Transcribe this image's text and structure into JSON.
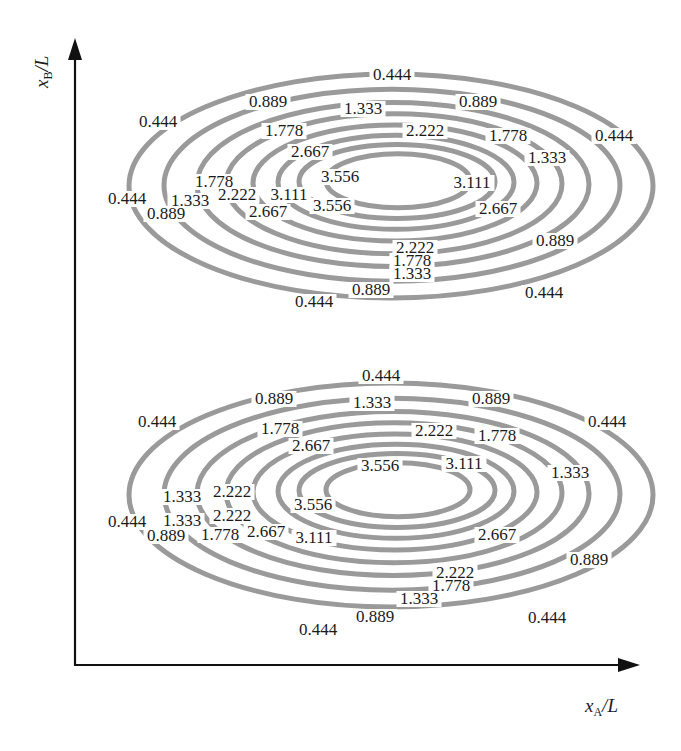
{
  "chart_data": {
    "type": "contour",
    "title": "",
    "xlabel": "x_A/L",
    "ylabel": "x_B/L",
    "grid": false,
    "legend": null,
    "levels": [
      0.444,
      0.889,
      1.333,
      1.778,
      2.222,
      2.667,
      3.111,
      3.556
    ],
    "level_labels": [
      "0.444",
      "0.889",
      "1.333",
      "1.778",
      "2.222",
      "2.667",
      "3.111",
      "3.556"
    ],
    "line_color": "#9a9a9a",
    "lobes": [
      {
        "name": "upper",
        "center_px": [
          395,
          183
        ],
        "labels": [
          {
            "text": "0.444",
            "x": 392,
            "y": 80
          },
          {
            "text": "0.889",
            "x": 268,
            "y": 107
          },
          {
            "text": "1.333",
            "x": 363,
            "y": 114
          },
          {
            "text": "0.889",
            "x": 478,
            "y": 107
          },
          {
            "text": "0.444",
            "x": 158,
            "y": 127
          },
          {
            "text": "1.778",
            "x": 284,
            "y": 136
          },
          {
            "text": "2.222",
            "x": 425,
            "y": 136
          },
          {
            "text": "1.778",
            "x": 508,
            "y": 141
          },
          {
            "text": "0.444",
            "x": 614,
            "y": 141
          },
          {
            "text": "2.667",
            "x": 310,
            "y": 157
          },
          {
            "text": "3.556",
            "x": 340,
            "y": 182
          },
          {
            "text": "1.333",
            "x": 547,
            "y": 163
          },
          {
            "text": "1.778",
            "x": 214,
            "y": 187
          },
          {
            "text": "3.111",
            "x": 472,
            "y": 188
          },
          {
            "text": "0.444",
            "x": 127,
            "y": 204
          },
          {
            "text": "1.333",
            "x": 190,
            "y": 206
          },
          {
            "text": "2.222",
            "x": 237,
            "y": 200
          },
          {
            "text": "3.111",
            "x": 289,
            "y": 200
          },
          {
            "text": "3.556",
            "x": 332,
            "y": 211
          },
          {
            "text": "0.889",
            "x": 166,
            "y": 219
          },
          {
            "text": "2.667",
            "x": 268,
            "y": 217
          },
          {
            "text": "2.667",
            "x": 498,
            "y": 214
          },
          {
            "text": "2.222",
            "x": 415,
            "y": 253
          },
          {
            "text": "0.889",
            "x": 555,
            "y": 246
          },
          {
            "text": "1.778",
            "x": 412,
            "y": 266
          },
          {
            "text": "1.333",
            "x": 412,
            "y": 279
          },
          {
            "text": "0.889",
            "x": 371,
            "y": 295
          },
          {
            "text": "0.444",
            "x": 544,
            "y": 298
          },
          {
            "text": "0.444",
            "x": 314,
            "y": 307
          }
        ]
      },
      {
        "name": "lower",
        "center_px": [
          395,
          492
        ],
        "labels": [
          {
            "text": "0.444",
            "x": 381,
            "y": 381
          },
          {
            "text": "0.889",
            "x": 274,
            "y": 404
          },
          {
            "text": "1.333",
            "x": 372,
            "y": 408
          },
          {
            "text": "0.889",
            "x": 491,
            "y": 404
          },
          {
            "text": "0.444",
            "x": 157,
            "y": 427
          },
          {
            "text": "1.778",
            "x": 280,
            "y": 434
          },
          {
            "text": "2.222",
            "x": 434,
            "y": 436
          },
          {
            "text": "1.778",
            "x": 497,
            "y": 441
          },
          {
            "text": "0.444",
            "x": 607,
            "y": 427
          },
          {
            "text": "2.667",
            "x": 311,
            "y": 451
          },
          {
            "text": "3.556",
            "x": 380,
            "y": 471
          },
          {
            "text": "3.111",
            "x": 464,
            "y": 469
          },
          {
            "text": "1.333",
            "x": 570,
            "y": 478
          },
          {
            "text": "1.333",
            "x": 182,
            "y": 502
          },
          {
            "text": "2.222",
            "x": 232,
            "y": 497
          },
          {
            "text": "3.556",
            "x": 313,
            "y": 510
          },
          {
            "text": "0.444",
            "x": 127,
            "y": 527
          },
          {
            "text": "1.333",
            "x": 182,
            "y": 526
          },
          {
            "text": "2.222",
            "x": 232,
            "y": 521
          },
          {
            "text": "0.889",
            "x": 166,
            "y": 541
          },
          {
            "text": "1.778",
            "x": 220,
            "y": 540
          },
          {
            "text": "2.667",
            "x": 266,
            "y": 537
          },
          {
            "text": "3.111",
            "x": 314,
            "y": 543
          },
          {
            "text": "2.667",
            "x": 497,
            "y": 540
          },
          {
            "text": "0.889",
            "x": 589,
            "y": 565
          },
          {
            "text": "2.222",
            "x": 455,
            "y": 578
          },
          {
            "text": "1.778",
            "x": 451,
            "y": 591
          },
          {
            "text": "1.333",
            "x": 419,
            "y": 604
          },
          {
            "text": "0.889",
            "x": 375,
            "y": 622
          },
          {
            "text": "0.444",
            "x": 547,
            "y": 623
          },
          {
            "text": "0.444",
            "x": 318,
            "y": 635
          }
        ]
      }
    ],
    "ellipse_radii_px": [
      {
        "level": "0.444",
        "rx": 262,
        "ry": 112
      },
      {
        "level": "0.889",
        "rx": 228,
        "ry": 96
      },
      {
        "level": "1.333",
        "rx": 196,
        "ry": 82
      },
      {
        "level": "1.778",
        "rx": 168,
        "ry": 70
      },
      {
        "level": "2.222",
        "rx": 142,
        "ry": 58
      },
      {
        "level": "2.667",
        "rx": 118,
        "ry": 47
      },
      {
        "level": "3.111",
        "rx": 98,
        "ry": 37
      },
      {
        "level": "3.556",
        "rx": 72,
        "ry": 27
      }
    ],
    "axes_px": {
      "origin": [
        75,
        665
      ],
      "x_end": [
        640,
        665
      ],
      "y_end": [
        75,
        38
      ]
    }
  },
  "axis": {
    "y_main": "x",
    "y_sub": "B",
    "y_tail": "/L",
    "x_main": "x",
    "x_sub": "A",
    "x_tail": "/L"
  }
}
